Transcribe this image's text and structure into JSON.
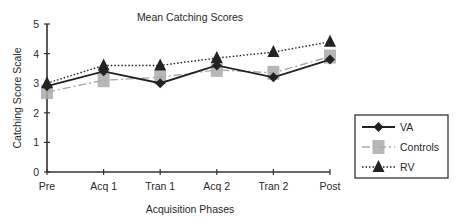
{
  "chart_data": {
    "type": "line",
    "title": "Mean Catching Scores",
    "xlabel": "Acquisition Phases",
    "ylabel": "Catching Score Scale",
    "categories": [
      "Pre",
      "Acq 1",
      "Tran 1",
      "Acq 2",
      "Tran 2",
      "Post"
    ],
    "yticks": [
      0,
      1,
      2,
      3,
      4,
      5
    ],
    "ylim": [
      0,
      5
    ],
    "grid": false,
    "legend_position": "right",
    "series": [
      {
        "name": "VA",
        "marker": "diamond",
        "line": "solid",
        "color": "#222222",
        "values": [
          2.9,
          3.4,
          3.0,
          3.6,
          3.2,
          3.8
        ]
      },
      {
        "name": "Controls",
        "marker": "square",
        "line": "dash-dot",
        "color": "#aaaaaa",
        "values": [
          2.7,
          3.1,
          3.2,
          3.45,
          3.35,
          3.9
        ]
      },
      {
        "name": "RV",
        "marker": "triangle",
        "line": "dotted",
        "color": "#222222",
        "values": [
          3.0,
          3.6,
          3.6,
          3.85,
          4.05,
          4.4
        ]
      }
    ]
  }
}
